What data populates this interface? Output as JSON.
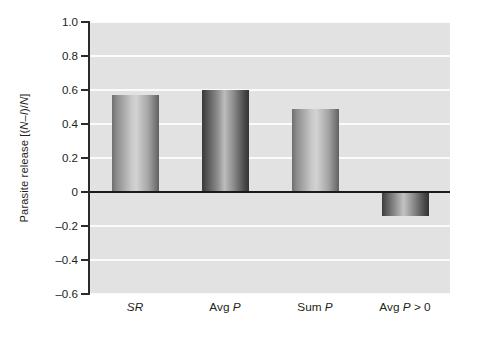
{
  "chart_data": {
    "type": "bar",
    "title": "",
    "subtitle": "",
    "xlabel": "",
    "ylabel": "Parasite release [(N–I)/N]",
    "ylabel_parts": [
      {
        "text": "Parasite release [(",
        "italic": false
      },
      {
        "text": "N",
        "italic": true
      },
      {
        "text": "–",
        "italic": false
      },
      {
        "text": "I",
        "italic": true
      },
      {
        "text": ")/",
        "italic": false
      },
      {
        "text": "N",
        "italic": true
      },
      {
        "text": "]",
        "italic": false
      }
    ],
    "categories": [
      "SR",
      "Avg P",
      "Sum P",
      "Avg P > 0"
    ],
    "category_parts": [
      [
        {
          "text": "SR",
          "italic": true
        }
      ],
      [
        {
          "text": "Avg ",
          "italic": false
        },
        {
          "text": "P",
          "italic": true
        }
      ],
      [
        {
          "text": "Sum ",
          "italic": false
        },
        {
          "text": "P",
          "italic": true
        }
      ],
      [
        {
          "text": "Avg ",
          "italic": false
        },
        {
          "text": "P",
          "italic": true
        },
        {
          "text": " > 0",
          "italic": false
        }
      ]
    ],
    "values": [
      0.57,
      0.6,
      0.49,
      -0.14
    ],
    "ylim": [
      -0.6,
      1.0
    ],
    "yticks": [
      1.0,
      0.8,
      0.6,
      0.4,
      0.2,
      0,
      -0.2,
      -0.4,
      -0.6
    ],
    "ytick_labels": [
      "1.0",
      "0.8",
      "0.6",
      "0.4",
      "0.2",
      "0",
      "–0.2",
      "–0.4",
      "–0.6"
    ],
    "grid": true,
    "gridline_color": "#fbfbfb",
    "zero_line_color": "#1a1a1a",
    "plot_background": "#e2e2e2",
    "legend": null,
    "legend_position": "none",
    "bar_styles": [
      {
        "name": "SR",
        "gradient": "linear-gradient(to right, #6f6f6f 0%, #8d8d8d 10%, #c9c9c9 42%, #d2d2d2 52%, #a3a3a3 78%, #6d6d6d 96%, #5e5e5e 100%)"
      },
      {
        "name": "Avg P",
        "gradient": "linear-gradient(to right, #3a3a3a 0%, #4d4d4d 8%, #8f8f8f 34%, #bdbdbd 48%, #8a8a8a 68%, #4a4a4a 90%, #343434 100%)"
      },
      {
        "name": "Sum P",
        "gradient": "linear-gradient(to right, #6f6f6f 0%, #8d8d8d 10%, #c9c9c9 42%, #d2d2d2 52%, #a3a3a3 78%, #6d6d6d 96%, #5e5e5e 100%)"
      },
      {
        "name": "Avg P > 0",
        "gradient": "linear-gradient(to right, #3d3d3d 0%, #555555 8%, #9b9b9b 32%, #c2c2c2 46%, #8d8d8d 66%, #4a4a4a 90%, #313131 100%)"
      }
    ]
  }
}
